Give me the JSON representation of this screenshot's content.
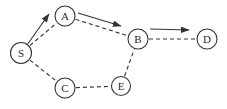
{
  "diagram": {
    "type": "graph",
    "background_color": "#ffffff",
    "line_color": "#333333",
    "text_color": "#2b2b2b",
    "node_fill_color": "#ffffff",
    "nodes": [
      {
        "id": "S",
        "label": "S",
        "x": 21,
        "y": 53,
        "r": 10.5
      },
      {
        "id": "A",
        "label": "A",
        "x": 65,
        "y": 16,
        "r": 10
      },
      {
        "id": "B",
        "label": "B",
        "x": 138,
        "y": 39,
        "r": 10
      },
      {
        "id": "D",
        "label": "D",
        "x": 207,
        "y": 39,
        "r": 10
      },
      {
        "id": "C",
        "label": "C",
        "x": 65,
        "y": 88,
        "r": 10
      },
      {
        "id": "E",
        "label": "E",
        "x": 121,
        "y": 86,
        "r": 9.5
      }
    ],
    "edges": [
      {
        "from": "S",
        "to": "A",
        "style": "dashed"
      },
      {
        "from": "A",
        "to": "B",
        "style": "dashed"
      },
      {
        "from": "B",
        "to": "D",
        "style": "dashed"
      },
      {
        "from": "S",
        "to": "C",
        "style": "dashed"
      },
      {
        "from": "C",
        "to": "E",
        "style": "dashed"
      },
      {
        "from": "E",
        "to": "B",
        "style": "dashed"
      }
    ],
    "path_arrows": [
      {
        "name": "path-arrow-s-to-a",
        "x1": 27,
        "y1": 45,
        "x2": 49,
        "y2": 14
      },
      {
        "name": "path-arrow-a-to-b",
        "x1": 78,
        "y1": 13,
        "x2": 121,
        "y2": 26
      },
      {
        "name": "path-arrow-b-to-d",
        "x1": 150,
        "y1": 29,
        "x2": 189,
        "y2": 30
      }
    ]
  }
}
